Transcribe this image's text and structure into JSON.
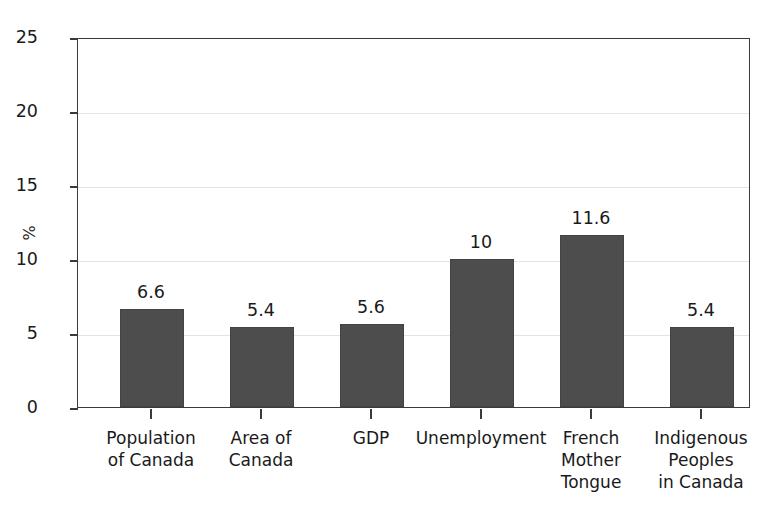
{
  "chart_data": {
    "type": "bar",
    "title": "",
    "subtitle": "",
    "xlabel": "",
    "ylabel": "%",
    "ylim": [
      0,
      25
    ],
    "yticks": [
      0,
      5,
      10,
      15,
      20,
      25
    ],
    "ytick_labels": [
      "0",
      "5",
      "10",
      "15",
      "20",
      "25"
    ],
    "grid": true,
    "legend": null,
    "categories": [
      "Population\nof Canada",
      "Area of\nCanada",
      "GDP",
      "Unemployment",
      "French\nMother\nTongue",
      "Indigenous\nPeoples\nin Canada"
    ],
    "values": [
      6.6,
      5.4,
      5.6,
      10,
      11.6,
      5.4
    ],
    "value_labels": [
      "6.6",
      "5.4",
      "5.6",
      "10",
      "11.6",
      "5.4"
    ],
    "bar_color": "#4d4d4d",
    "axis_color": "#3a3a3a",
    "grid_color": "#e3e3e3",
    "background_color": "#ffffff"
  }
}
